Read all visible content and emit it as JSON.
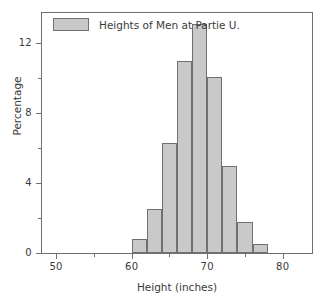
{
  "chart_data": {
    "type": "bar",
    "title": "",
    "xlabel": "Height (inches)",
    "ylabel": "Percentage",
    "xlim": [
      48,
      84
    ],
    "ylim": [
      0,
      13.8
    ],
    "grid": false,
    "legend_position": "top-left",
    "legend": [
      "Heights of Men at Partie U."
    ],
    "bin_width": 2,
    "bin_edges": [
      60,
      62,
      64,
      66,
      68,
      70,
      72,
      74,
      76,
      78
    ],
    "categories": [
      "60-62",
      "62-64",
      "64-66",
      "66-68",
      "68-70",
      "70-72",
      "72-74",
      "74-76",
      "76-78"
    ],
    "values": [
      0.8,
      2.5,
      6.3,
      11.0,
      13.1,
      10.1,
      5.0,
      1.8,
      0.5
    ],
    "x_ticks": [
      50,
      60,
      70,
      80
    ],
    "x_tick_labels": [
      "50",
      "60",
      "70",
      "80"
    ],
    "x_minor_ticks": [
      55,
      65,
      75
    ],
    "y_ticks": [
      0,
      4,
      8,
      12
    ],
    "y_tick_labels": [
      "0",
      "4",
      "8",
      "12"
    ],
    "y_minor_ticks": [
      2,
      6,
      10
    ],
    "colors": {
      "bar_fill": "#c9c9c9",
      "bar_edge": "#707070",
      "axis": "#6f6f6f",
      "text": "#3a3a3a",
      "background": "#ffffff"
    }
  }
}
